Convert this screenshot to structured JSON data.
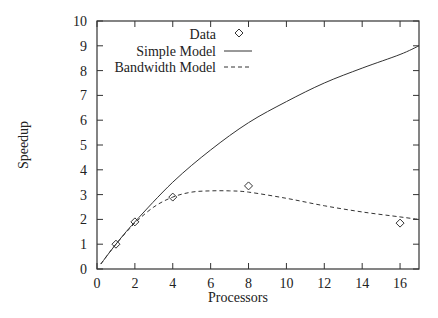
{
  "chart_data": {
    "type": "line",
    "title": "",
    "xlabel": "Processors",
    "ylabel": "Speedup",
    "xlim": [
      0,
      17
    ],
    "ylim": [
      0,
      10
    ],
    "xticks": [
      0,
      2,
      4,
      6,
      8,
      10,
      12,
      14,
      16
    ],
    "yticks": [
      0,
      1,
      2,
      3,
      4,
      5,
      6,
      7,
      8,
      9,
      10
    ],
    "grid": false,
    "legend_position": "top-left inside",
    "series": [
      {
        "name": "Data",
        "style": "diamond markers",
        "x": [
          1,
          2,
          4,
          8,
          16
        ],
        "y": [
          1.0,
          1.9,
          2.9,
          3.35,
          1.85
        ]
      },
      {
        "name": "Simple Model",
        "style": "solid",
        "x": [
          0.2,
          1,
          2,
          4,
          6,
          8,
          10,
          12,
          14,
          16,
          17
        ],
        "y": [
          0.2,
          1.0,
          1.9,
          3.5,
          4.8,
          5.9,
          6.75,
          7.5,
          8.1,
          8.65,
          9.0
        ]
      },
      {
        "name": "Bandwidth Model",
        "style": "dashed",
        "x": [
          0.2,
          1,
          2,
          3,
          4,
          5,
          6,
          7,
          8,
          10,
          12,
          14,
          16,
          17
        ],
        "y": [
          0.2,
          1.0,
          1.85,
          2.5,
          2.9,
          3.1,
          3.15,
          3.15,
          3.1,
          2.85,
          2.55,
          2.3,
          2.1,
          2.0
        ]
      }
    ]
  },
  "legend": {
    "data": "Data",
    "simple": "Simple Model",
    "bandwidth": "Bandwidth Model"
  },
  "axes": {
    "xlabel": "Processors",
    "ylabel": "Speedup"
  }
}
